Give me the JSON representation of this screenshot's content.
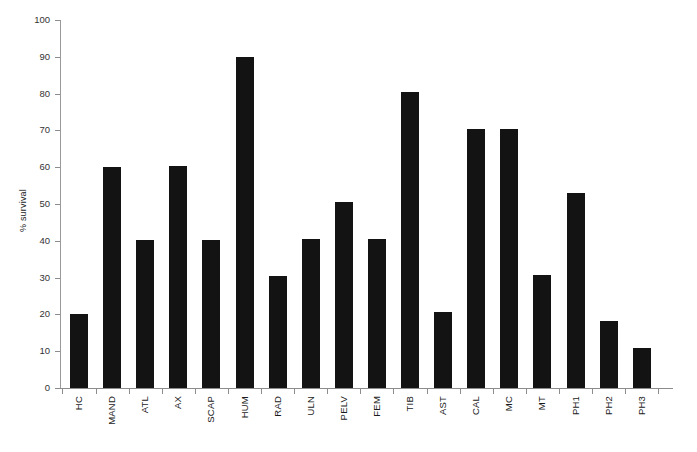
{
  "chart_data": {
    "type": "bar",
    "title": "",
    "subtitle": "",
    "xlabel": "",
    "ylabel": "% survival",
    "ylim": [
      0,
      100
    ],
    "ytick_step": 10,
    "yticks": [
      0,
      10,
      20,
      30,
      40,
      50,
      60,
      70,
      80,
      90,
      100
    ],
    "ytick_labels": [
      "0",
      "10",
      "20",
      "30",
      "40",
      "50",
      "60",
      "70",
      "80",
      "90",
      "100"
    ],
    "grid": false,
    "legend": null,
    "legend_position": "none",
    "bar_color": "#131313",
    "axis_color": "#8c8c8c",
    "categories": [
      "HC",
      "MAND",
      "ATL",
      "AX",
      "SCAP",
      "HUM",
      "RAD",
      "ULN",
      "PELV",
      "FEM",
      "TIB",
      "AST",
      "CAL",
      "MC",
      "MT",
      "PH1",
      "PH2",
      "PH3"
    ],
    "values": [
      20.0,
      60.0,
      40.3,
      60.2,
      40.3,
      90.0,
      30.3,
      40.5,
      50.6,
      40.5,
      80.5,
      20.6,
      70.5,
      70.5,
      30.8,
      53.0,
      18.3,
      10.9
    ],
    "series": [
      {
        "name": "% survival",
        "values": [
          20.0,
          60.0,
          40.3,
          60.2,
          40.3,
          90.0,
          30.3,
          40.5,
          50.6,
          40.5,
          80.5,
          20.6,
          70.5,
          70.5,
          30.8,
          53.0,
          18.3,
          10.9
        ]
      }
    ],
    "annotations": []
  }
}
